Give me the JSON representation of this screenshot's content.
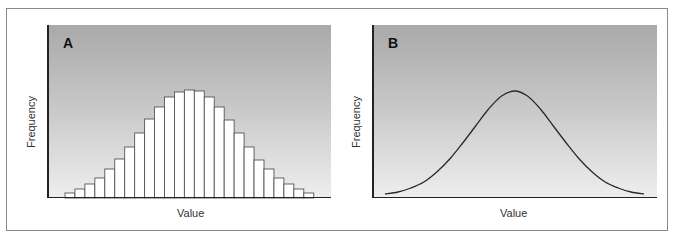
{
  "figure": {
    "panels": [
      {
        "label": "A",
        "xlabel": "Value",
        "ylabel": "Frequency"
      },
      {
        "label": "B",
        "xlabel": "Value",
        "ylabel": "Frequency"
      }
    ]
  },
  "chart_data": [
    {
      "type": "bar",
      "title": "A",
      "xlabel": "Value",
      "ylabel": "Frequency",
      "categories": [
        "1",
        "2",
        "3",
        "4",
        "5",
        "6",
        "7",
        "8",
        "9",
        "10",
        "11",
        "12",
        "13",
        "14",
        "15",
        "16",
        "17",
        "18",
        "19",
        "20",
        "21",
        "22",
        "23",
        "24",
        "25"
      ],
      "values": [
        5,
        9,
        14,
        20,
        29,
        39,
        51,
        65,
        79,
        91,
        101,
        106,
        108,
        107,
        101,
        91,
        78,
        65,
        51,
        38,
        29,
        20,
        14,
        9,
        5
      ],
      "ylim": [
        0,
        172
      ],
      "grid": false,
      "tick_labels": false,
      "note": "Histogram approximating a normal distribution; values are relative bar heights in pixels"
    },
    {
      "type": "line",
      "title": "B",
      "xlabel": "Value",
      "ylabel": "Frequency",
      "x": [
        0,
        0.05,
        0.1,
        0.15,
        0.2,
        0.25,
        0.3,
        0.35,
        0.4,
        0.45,
        0.5,
        0.55,
        0.6,
        0.65,
        0.7,
        0.75,
        0.8,
        0.85,
        0.9,
        0.95,
        1.0
      ],
      "values": [
        3,
        5,
        9,
        15,
        25,
        38,
        54,
        71,
        88,
        101,
        106,
        101,
        88,
        71,
        54,
        38,
        25,
        15,
        9,
        5,
        3
      ],
      "ylim": [
        0,
        172
      ],
      "grid": false,
      "tick_labels": false,
      "note": "Smooth normal (bell) curve; values are relative heights in pixels"
    }
  ]
}
